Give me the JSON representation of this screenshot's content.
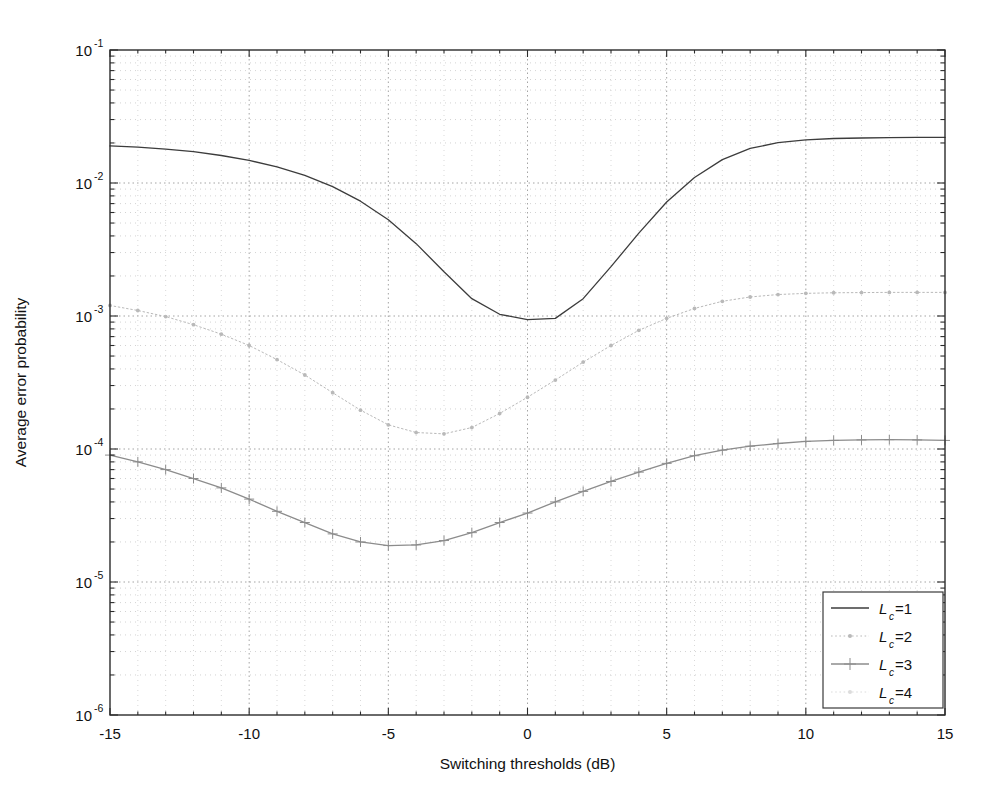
{
  "figure": {
    "background": "#ffffff",
    "plot_area": {
      "left": 110,
      "top": 50,
      "right": 945,
      "bottom": 715
    }
  },
  "chart_data": {
    "type": "line",
    "title": "",
    "subtitle": "",
    "xlabel": "Switching thresholds (dB)",
    "ylabel": "Average error probability",
    "xscale": "linear",
    "yscale": "log",
    "xlim": [
      -15,
      15
    ],
    "ylim": [
      1e-06,
      0.1
    ],
    "xticks": [
      -15,
      -10,
      -5,
      0,
      5,
      10,
      15
    ],
    "xticklabels": [
      "-15",
      "-10",
      "-5",
      "0",
      "5",
      "10",
      "15"
    ],
    "yticks": [
      1e-06,
      1e-05,
      0.0001,
      0.001,
      0.01,
      0.1
    ],
    "yticklabels": [
      "10^-6",
      "10^-5",
      "10^-4",
      "10^-3",
      "10^-2",
      "10^-1"
    ],
    "ytick_bases": [
      "10",
      "10",
      "10",
      "10",
      "10",
      "10"
    ],
    "ytick_exponents": [
      "-6",
      "-5",
      "-4",
      "-3",
      "-2",
      "-1"
    ],
    "grid": true,
    "grid_style": "dotted",
    "grid_minor": true,
    "legend_position": "lower right",
    "series": [
      {
        "name": "L_c=1",
        "label_base": "L",
        "label_sub": "c",
        "label_eq": "=1",
        "color": "#3c3c3c",
        "linestyle": "solid",
        "marker": "none",
        "x": [
          -15,
          -14,
          -13,
          -12,
          -11,
          -10,
          -9,
          -8,
          -7,
          -6,
          -5,
          -4,
          -3,
          -2,
          -1,
          0,
          1,
          2,
          3,
          4,
          5,
          6,
          7,
          8,
          9,
          10,
          11,
          12,
          13,
          14,
          15
        ],
        "y": [
          0.019,
          0.0186,
          0.018,
          0.0172,
          0.0161,
          0.0148,
          0.0132,
          0.0114,
          0.0094,
          0.0073,
          0.0053,
          0.0035,
          0.00215,
          0.00135,
          0.00103,
          0.00094,
          0.00096,
          0.00135,
          0.00235,
          0.0042,
          0.0072,
          0.011,
          0.015,
          0.0182,
          0.0201,
          0.0211,
          0.0216,
          0.0218,
          0.0219,
          0.022,
          0.022
        ]
      },
      {
        "name": "L_c=2",
        "label_base": "L",
        "label_sub": "c",
        "label_eq": "=2",
        "color": "#b9b9b9",
        "linestyle": "dotted",
        "marker": "dot",
        "x": [
          -15,
          -14,
          -13,
          -12,
          -11,
          -10,
          -9,
          -8,
          -7,
          -6,
          -5,
          -4,
          -3,
          -2,
          -1,
          0,
          1,
          2,
          3,
          4,
          5,
          6,
          7,
          8,
          9,
          10,
          11,
          12,
          13,
          14,
          15
        ],
        "y": [
          0.0012,
          0.0011,
          0.00099,
          0.00086,
          0.00073,
          0.0006,
          0.00047,
          0.00036,
          0.000265,
          0.000196,
          0.000152,
          0.000133,
          0.00013,
          0.000145,
          0.000185,
          0.000245,
          0.00033,
          0.00045,
          0.0006,
          0.00078,
          0.00096,
          0.00114,
          0.00129,
          0.00139,
          0.00145,
          0.00148,
          0.001495,
          0.0015,
          0.001505,
          0.001505,
          0.001505
        ]
      },
      {
        "name": "L_c=3",
        "label_base": "L",
        "label_sub": "c",
        "label_eq": "=3",
        "color": "#8c8c8c",
        "linestyle": "solid",
        "marker": "plus",
        "x": [
          -15,
          -14,
          -13,
          -12,
          -11,
          -10,
          -9,
          -8,
          -7,
          -6,
          -5,
          -4,
          -3,
          -2,
          -1,
          0,
          1,
          2,
          3,
          4,
          5,
          6,
          7,
          8,
          9,
          10,
          11,
          12,
          13,
          14,
          15
        ],
        "y": [
          9e-05,
          8e-05,
          7e-05,
          6e-05,
          5.1e-05,
          4.2e-05,
          3.4e-05,
          2.8e-05,
          2.3e-05,
          2e-05,
          1.88e-05,
          1.9e-05,
          2.05e-05,
          2.35e-05,
          2.8e-05,
          3.3e-05,
          4e-05,
          4.8e-05,
          5.7e-05,
          6.7e-05,
          7.8e-05,
          8.9e-05,
          9.8e-05,
          0.000105,
          0.00011,
          0.000114,
          0.000116,
          0.000117,
          0.0001175,
          0.000117,
          0.000116
        ]
      },
      {
        "name": "L_c=4",
        "label_base": "L",
        "label_sub": "c",
        "label_eq": "=4",
        "color": "#dcdcdc",
        "linestyle": "dotted",
        "marker": "dot",
        "x": [],
        "y": []
      }
    ]
  },
  "legend": {
    "items": [
      {
        "label_base": "L",
        "label_sub": "c",
        "label_eq": "=1"
      },
      {
        "label_base": "L",
        "label_sub": "c",
        "label_eq": "=2"
      },
      {
        "label_base": "L",
        "label_sub": "c",
        "label_eq": "=3"
      },
      {
        "label_base": "L",
        "label_sub": "c",
        "label_eq": "=4"
      }
    ]
  }
}
